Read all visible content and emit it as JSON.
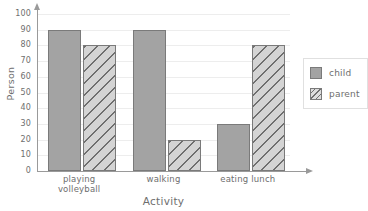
{
  "chart_data": {
    "type": "bar",
    "title": "",
    "xlabel": "Activity",
    "ylabel": "Person",
    "categories": [
      "playing volleyball",
      "walking",
      "eating lunch"
    ],
    "category_lines": [
      [
        "playing",
        "volleyball"
      ],
      [
        "walking"
      ],
      [
        "eating lunch"
      ]
    ],
    "series": [
      {
        "name": "child",
        "values": [
          90,
          90,
          30
        ],
        "color": "#a3a3a3",
        "pattern": "solid"
      },
      {
        "name": "parent",
        "values": [
          80,
          20,
          80
        ],
        "color": "#d4d4d4",
        "pattern": "diagonal-hatch"
      }
    ],
    "ylim": [
      0,
      100
    ],
    "ytick_labels": [
      "100",
      "90",
      "80",
      "70",
      "60",
      "50",
      "40",
      "30",
      "20",
      "10",
      "0"
    ],
    "ytick_values": [
      100,
      90,
      80,
      70,
      60,
      50,
      40,
      30,
      20,
      10,
      0
    ],
    "grid": "horizontal",
    "grid_color": "#ededed",
    "legend_position": "right",
    "axis_color": "#9a9a9a",
    "background": "#ffffff",
    "text_color": "#6e6e6e"
  },
  "legend": {
    "items": [
      {
        "label": "child"
      },
      {
        "label": "parent"
      }
    ]
  }
}
